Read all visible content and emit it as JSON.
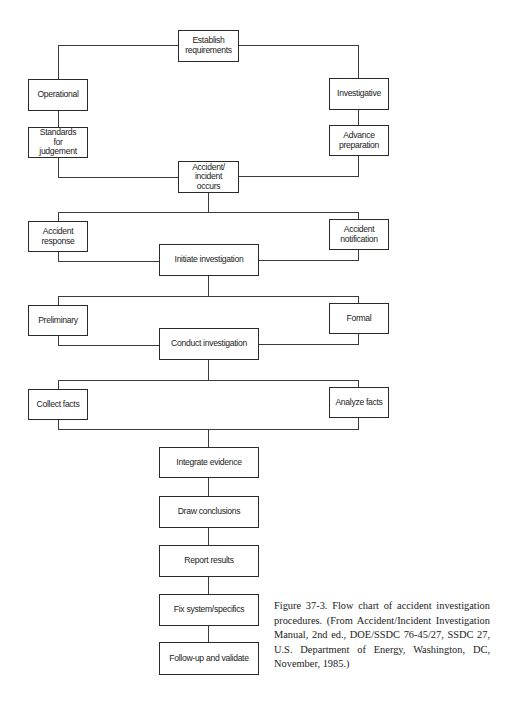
{
  "figure": {
    "type": "flowchart",
    "title": "Flow chart of accident investigation procedures"
  },
  "nodes": {
    "establish": "Establish\nrequirements",
    "operational": "Operational",
    "investigative": "Investigative",
    "standards": "Standards\nfor\njudgement",
    "advance": "Advance\npreparation",
    "occurs": "Accident/\nincident\noccurs",
    "response": "Accident\nresponse",
    "notification": "Accident\nnotification",
    "initiate": "Initiate investigation",
    "preliminary": "Preliminary",
    "formal": "Formal",
    "conduct": "Conduct investigation",
    "collect": "Collect facts",
    "analyze": "Analyze facts",
    "integrate": "Integrate evidence",
    "draw": "Draw conclusions",
    "report": "Report results",
    "fix": "Fix system/specifics",
    "followup": "Follow-up and validate"
  },
  "edges": [
    [
      "establish",
      "operational"
    ],
    [
      "establish",
      "investigative"
    ],
    [
      "operational",
      "standards"
    ],
    [
      "investigative",
      "advance"
    ],
    [
      "standards",
      "occurs"
    ],
    [
      "advance",
      "occurs"
    ],
    [
      "occurs",
      "response"
    ],
    [
      "occurs",
      "notification"
    ],
    [
      "response",
      "initiate"
    ],
    [
      "notification",
      "initiate"
    ],
    [
      "initiate",
      "preliminary"
    ],
    [
      "initiate",
      "formal"
    ],
    [
      "preliminary",
      "conduct"
    ],
    [
      "formal",
      "conduct"
    ],
    [
      "conduct",
      "collect"
    ],
    [
      "conduct",
      "analyze"
    ],
    [
      "collect",
      "integrate"
    ],
    [
      "analyze",
      "integrate"
    ],
    [
      "integrate",
      "draw"
    ],
    [
      "draw",
      "report"
    ],
    [
      "report",
      "fix"
    ],
    [
      "fix",
      "followup"
    ]
  ],
  "caption": {
    "text": "Figure 37-3.   Flow chart of accident investigation procedures. (From Accident/Incident Investigation Manual, 2nd ed., DOE/SSDC 76-45/27, SSDC 27, U.S. Department of Energy, Washington, DC, November, 1985.)"
  }
}
